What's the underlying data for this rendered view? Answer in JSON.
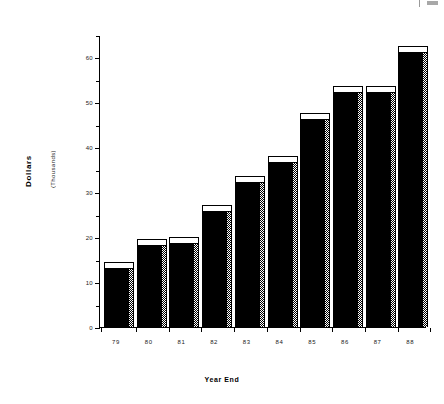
{
  "chart_data": {
    "type": "bar",
    "title": "",
    "subtitle": "",
    "xlabel": "Year End",
    "ylabel": "Dollars",
    "ylabel_units": "(Thousands)",
    "categories": [
      "79",
      "80",
      "81",
      "82",
      "83",
      "84",
      "85",
      "86",
      "87",
      "88"
    ],
    "values": [
      13,
      18,
      18.5,
      25.5,
      32,
      36.5,
      46,
      52,
      52,
      61
    ],
    "ylim": [
      0,
      65
    ],
    "xlim_note": "categorical, 10 bars",
    "ytick_labels": [
      "0",
      "10",
      "20",
      "30",
      "40",
      "50",
      "60"
    ],
    "ytick_values": [
      0,
      10,
      20,
      30,
      40,
      50,
      60
    ],
    "yminor_values": [
      5,
      15,
      25,
      35,
      45,
      55,
      65
    ],
    "grid": false,
    "legend": false,
    "legend_position": "none",
    "style": "3d-bar-black-fill-white-top-dithered-side",
    "colors": {
      "bar_front": "#000000",
      "bar_top": "#ffffff",
      "bar_side": "#808080",
      "axis": "#000000",
      "text": "#000000",
      "background": "#ffffff"
    }
  },
  "artifact": {
    "name": "page-edge-crop-mark",
    "description": "partial cropped mark at top-right edge"
  }
}
